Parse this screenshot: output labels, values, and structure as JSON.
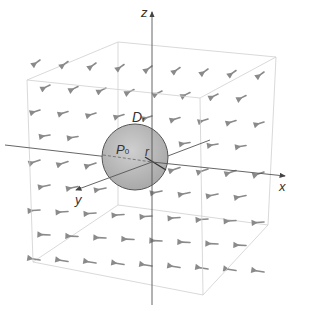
{
  "diagram": {
    "axes": {
      "x_label": "x",
      "y_label": "y",
      "z_label": "z"
    },
    "labels": {
      "region": "D",
      "region_sub": "r",
      "point": "P",
      "point_sub": "0",
      "radius": "r"
    },
    "colors": {
      "box_edges": "#c8c8c8",
      "axes": "#555555",
      "arrows": "#8a8a8a",
      "sphere_fill": "#bdbdbd",
      "sphere_stroke": "#555555"
    }
  }
}
